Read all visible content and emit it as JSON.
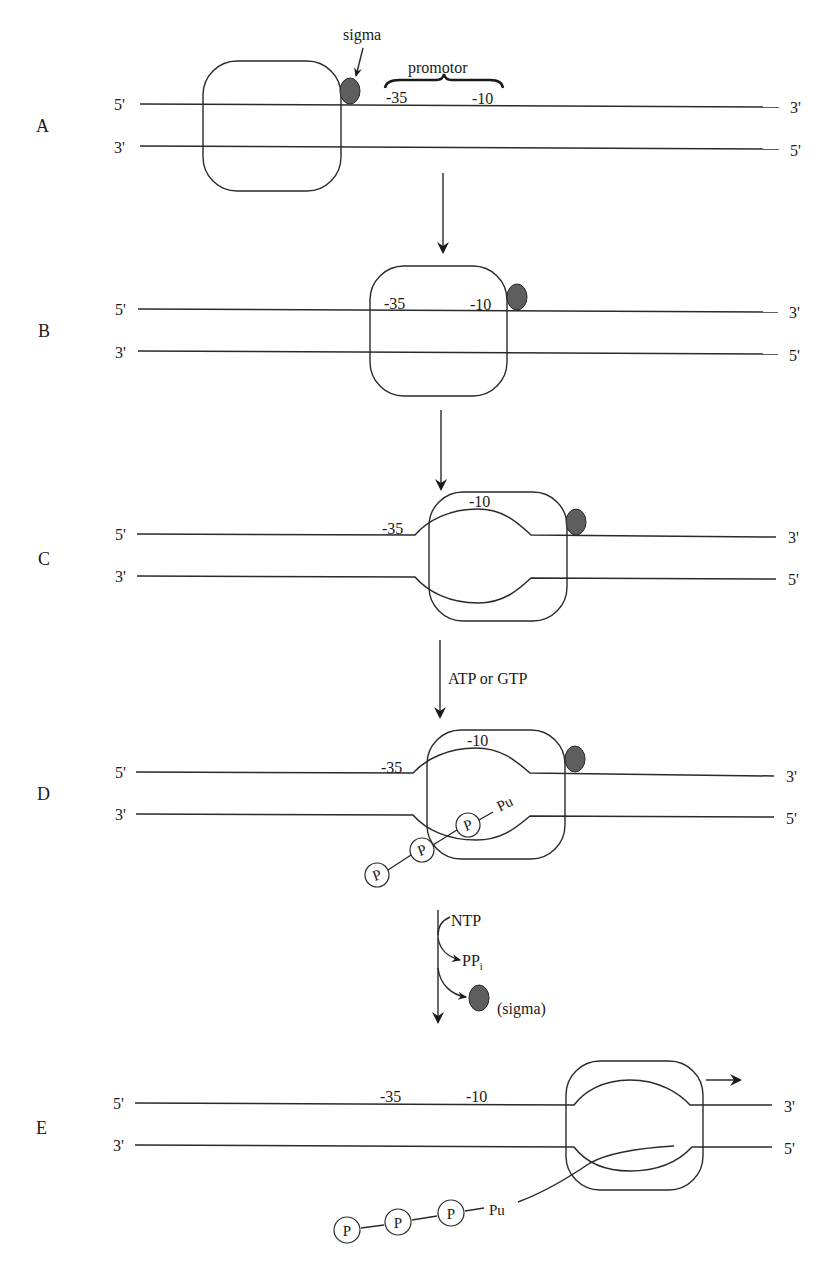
{
  "figure": {
    "colors": {
      "line": "#2a2a2a",
      "sigma_fill": "#5e5e5e",
      "background": "#ffffff"
    }
  },
  "labels": {
    "five_prime": "5'",
    "three_prime": "3'",
    "minus35": "-35",
    "minus10": "-10",
    "sigma": "sigma",
    "promotor": "promotor",
    "atp_gtp": "ATP or GTP",
    "ntp": "NTP",
    "ppi_main": "PP",
    "ppi_sub": "i",
    "sigma_released": "(sigma)",
    "phosphate": "P",
    "purine": "Pu"
  },
  "panels": [
    {
      "id": "A",
      "label": "A",
      "description": "RNA polymerase holoenzyme with sigma factor searching DNA upstream of promotor"
    },
    {
      "id": "B",
      "label": "B",
      "description": "Closed complex: polymerase bound at promotor covering -35 and -10"
    },
    {
      "id": "C",
      "label": "C",
      "description": "Open complex: DNA strands melted near -10"
    },
    {
      "id": "D",
      "label": "D",
      "description": "First nucleotide (pppPu) bound in open complex"
    },
    {
      "id": "E",
      "label": "E",
      "description": "Elongation: sigma released, polymerase moves downstream with nascent RNA"
    }
  ],
  "transitions": [
    {
      "from": "A",
      "to": "B",
      "label": ""
    },
    {
      "from": "B",
      "to": "C",
      "label": ""
    },
    {
      "from": "C",
      "to": "D",
      "label": "ATP or GTP"
    },
    {
      "from": "D",
      "to": "E",
      "label": "NTP → PPi + (sigma)"
    }
  ]
}
